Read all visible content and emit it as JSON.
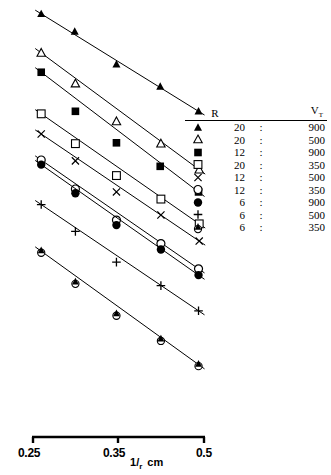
{
  "chart_data": {
    "type": "scatter",
    "title": "",
    "xlabel": "1/r cm",
    "ylabel": "",
    "xlim": [
      0.25,
      0.5
    ],
    "xticks": [
      0.25,
      0.35,
      0.5
    ],
    "xticklabels": [
      "0.25",
      "0.35",
      "0.5"
    ],
    "grid": false,
    "legend_position": "right",
    "legend_headers": {
      "marker": "",
      "r": "R",
      "v": "V",
      "v_sub": "T",
      "sep": ":"
    },
    "series": [
      {
        "name": "R20-V900",
        "marker": "filled-triangle",
        "r": "20",
        "v": "900",
        "sep": ":",
        "x": [
          0.262,
          0.311,
          0.372,
          0.436,
          0.492
        ],
        "y_px": [
          33,
          75,
          153,
          206,
          265
        ]
      },
      {
        "name": "R20-V500",
        "marker": "open-triangle",
        "r": "20",
        "v": "500",
        "sep": ":",
        "x": [
          0.262,
          0.312,
          0.372,
          0.437,
          0.493
        ],
        "y_px": [
          126,
          199,
          289,
          342,
          404
        ]
      },
      {
        "name": "R12-V900",
        "marker": "filled-square",
        "r": "12",
        "v": "900",
        "sep": ":",
        "x": [
          0.262,
          0.312,
          0.372,
          0.436,
          0.492
        ],
        "y_px": [
          172,
          265,
          340,
          396,
          457
        ]
      },
      {
        "name": "R20-V350",
        "marker": "open-square",
        "r": "20",
        "v": "350",
        "sep": ":",
        "x": [
          0.262,
          0.312,
          0.372,
          0.437,
          0.493
        ],
        "y_px": [
          271,
          342,
          418,
          474,
          533
        ]
      },
      {
        "name": "R12-V500",
        "marker": "cross-x",
        "r": "12",
        "v": "500",
        "sep": ":",
        "x": [
          0.262,
          0.312,
          0.372,
          0.437,
          0.493
        ],
        "y_px": [
          319,
          383,
          457,
          512,
          574
        ]
      },
      {
        "name": "R12-V350",
        "marker": "open-circle",
        "r": "12",
        "v": "350",
        "sep": ":",
        "x": [
          0.262,
          0.312,
          0.372,
          0.437,
          0.492
        ],
        "y_px": [
          381,
          450,
          524,
          580,
          640
        ]
      },
      {
        "name": "R6-V900",
        "marker": "filled-circle",
        "r": "6",
        "v": "900",
        "sep": ":",
        "x": [
          0.262,
          0.312,
          0.372,
          0.437,
          0.492
        ],
        "y_px": [
          392,
          460,
          536,
          594,
          655
        ]
      },
      {
        "name": "R6-V500",
        "marker": "plus",
        "r": "6",
        "v": "500",
        "sep": ":",
        "x": [
          0.262,
          0.312,
          0.372,
          0.437,
          0.492
        ],
        "y_px": [
          487,
          551,
          624,
          680,
          740
        ]
      },
      {
        "name": "R6-V350",
        "marker": "triangle-on-circle",
        "r": "6",
        "v": "350",
        "sep": ":",
        "x": [
          0.262,
          0.312,
          0.372,
          0.437,
          0.492
        ],
        "y_px": [
          598,
          672,
          748,
          808,
          868
        ]
      }
    ]
  },
  "axis": {
    "ticks": [
      {
        "label": "0.25",
        "value": 0.25
      },
      {
        "label": "0.35",
        "value": 0.35
      },
      {
        "label": "0.5",
        "value": 0.5
      }
    ],
    "title_numerator": "1",
    "title_denominator": "r",
    "title_unit": "cm"
  }
}
